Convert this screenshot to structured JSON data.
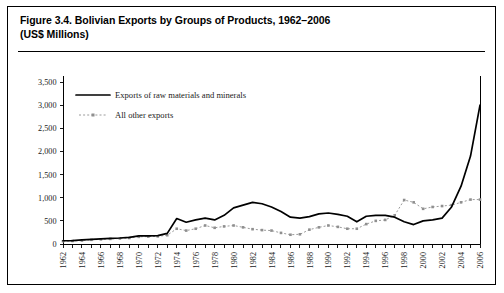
{
  "figure": {
    "title_line1": "Figure 3.4. Bolivian Exports by Groups of Products, 1962–2006",
    "title_line2": "(US$ Millions)"
  },
  "chart_data": {
    "type": "line",
    "title": "Figure 3.4. Bolivian Exports by Groups of Products, 1962–2006 (US$ Millions)",
    "xlabel": "",
    "ylabel": "",
    "ylim": [
      0,
      3500
    ],
    "ytick_labels": [
      "0",
      "500",
      "1,000",
      "1,500",
      "2,000",
      "2,500",
      "3,000",
      "3,500"
    ],
    "ytick_values": [
      0,
      500,
      1000,
      1500,
      2000,
      2500,
      3000,
      3500
    ],
    "grid": false,
    "legend_position": "upper-left-inside",
    "x": [
      1962,
      1963,
      1964,
      1965,
      1966,
      1967,
      1968,
      1969,
      1970,
      1971,
      1972,
      1973,
      1974,
      1975,
      1976,
      1977,
      1978,
      1979,
      1980,
      1981,
      1982,
      1983,
      1984,
      1985,
      1986,
      1987,
      1988,
      1989,
      1990,
      1991,
      1992,
      1993,
      1994,
      1995,
      1996,
      1997,
      1998,
      1999,
      2000,
      2001,
      2002,
      2003,
      2004,
      2005,
      2006
    ],
    "xtick_labels": [
      "1962",
      "1964",
      "1966",
      "1968",
      "1970",
      "1972",
      "1974",
      "1976",
      "1978",
      "1980",
      "1982",
      "1984",
      "1986",
      "1988",
      "1990",
      "1992",
      "1994",
      "1996",
      "1998",
      "2000",
      "2002",
      "2004",
      "2006"
    ],
    "series": [
      {
        "name": "Exports of raw materials and minerals",
        "style": "solid",
        "color": "#000000",
        "values": [
          70,
          75,
          90,
          100,
          110,
          120,
          130,
          145,
          175,
          175,
          180,
          230,
          550,
          470,
          520,
          560,
          520,
          620,
          780,
          840,
          900,
          870,
          800,
          700,
          580,
          560,
          590,
          650,
          670,
          640,
          600,
          480,
          600,
          620,
          620,
          580,
          480,
          420,
          500,
          520,
          560,
          800,
          1250,
          1900,
          3000
        ]
      },
      {
        "name": "All other exports",
        "style": "dotted-markers",
        "color": "#8f8f8f",
        "values": [
          60,
          65,
          75,
          90,
          100,
          110,
          120,
          130,
          155,
          160,
          165,
          190,
          330,
          290,
          330,
          400,
          350,
          380,
          400,
          360,
          320,
          300,
          290,
          240,
          200,
          210,
          310,
          360,
          400,
          370,
          330,
          330,
          430,
          500,
          520,
          620,
          950,
          900,
          760,
          800,
          820,
          840,
          900,
          960,
          960
        ]
      }
    ]
  },
  "legend": {
    "entries": [
      {
        "label": "Exports of raw materials and minerals"
      },
      {
        "label": "All other exports"
      }
    ]
  }
}
